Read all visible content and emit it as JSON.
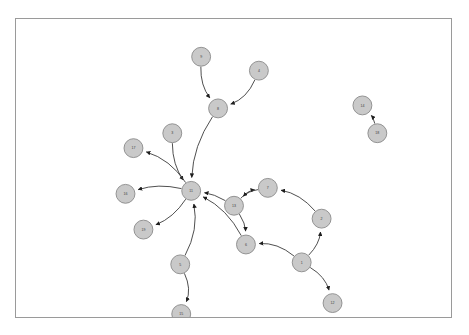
{
  "figure": {
    "kind": "directed-graph",
    "background_color": "#ffffff",
    "border_color": "#9a9a9a",
    "node_fill_color": "#c9c9c9",
    "node_stroke_color": "#8a8a8a",
    "edge_color": "#3a3a3a",
    "label_color": "#3d3d3d",
    "node_radius": 9.5
  },
  "graph_data": {
    "type": "node-link-diagram",
    "directed": true,
    "node_count": 18,
    "edge_count": 17,
    "nodes": [
      {
        "id": "1",
        "label": "1",
        "x": 287,
        "y": 245
      },
      {
        "id": "2",
        "label": "2",
        "x": 307,
        "y": 201
      },
      {
        "id": "3",
        "label": "3",
        "x": 157,
        "y": 115
      },
      {
        "id": "4",
        "label": "4",
        "x": 244,
        "y": 52
      },
      {
        "id": "5",
        "label": "5",
        "x": 165,
        "y": 247
      },
      {
        "id": "6",
        "label": "6",
        "x": 231,
        "y": 227
      },
      {
        "id": "7",
        "label": "7",
        "x": 253,
        "y": 170
      },
      {
        "id": "8",
        "label": "8",
        "x": 203,
        "y": 90
      },
      {
        "id": "9",
        "label": "9",
        "x": 186,
        "y": 38
      },
      {
        "id": "11",
        "label": "11",
        "x": 176,
        "y": 173
      },
      {
        "id": "12",
        "label": "12",
        "x": 318,
        "y": 286
      },
      {
        "id": "13",
        "label": "13",
        "x": 219,
        "y": 188
      },
      {
        "id": "14",
        "label": "14",
        "x": 348,
        "y": 87
      },
      {
        "id": "15",
        "label": "15",
        "x": 166,
        "y": 297
      },
      {
        "id": "16",
        "label": "16",
        "x": 110,
        "y": 176
      },
      {
        "id": "17",
        "label": "17",
        "x": 118,
        "y": 130
      },
      {
        "id": "18",
        "label": "18",
        "x": 363,
        "y": 115
      },
      {
        "id": "19",
        "label": "19",
        "x": 128,
        "y": 212
      }
    ],
    "edges": [
      {
        "source": "9",
        "target": "8",
        "curve": 0.18
      },
      {
        "source": "4",
        "target": "8",
        "curve": -0.22
      },
      {
        "source": "8",
        "target": "11",
        "curve": 0.14
      },
      {
        "source": "3",
        "target": "11",
        "curve": 0.16
      },
      {
        "source": "11",
        "target": "17",
        "curve": 0.18
      },
      {
        "source": "11",
        "target": "16",
        "curve": 0.14
      },
      {
        "source": "11",
        "target": "19",
        "curve": -0.16
      },
      {
        "source": "5",
        "target": "11",
        "curve": 0.18
      },
      {
        "source": "5",
        "target": "15",
        "curve": -0.22
      },
      {
        "source": "13",
        "target": "11",
        "curve": 0.1
      },
      {
        "source": "6",
        "target": "11",
        "curve": 0.16
      },
      {
        "source": "13",
        "target": "7",
        "curve": -0.18
      },
      {
        "source": "7",
        "target": "13",
        "curve": 0.16
      },
      {
        "source": "13",
        "target": "6",
        "curve": -0.14
      },
      {
        "source": "2",
        "target": "7",
        "curve": 0.18
      },
      {
        "source": "1",
        "target": "2",
        "curve": 0.18
      },
      {
        "source": "1",
        "target": "6",
        "curve": 0.2
      },
      {
        "source": "1",
        "target": "12",
        "curve": -0.2
      },
      {
        "source": "18",
        "target": "14",
        "curve": 0.12
      }
    ]
  }
}
